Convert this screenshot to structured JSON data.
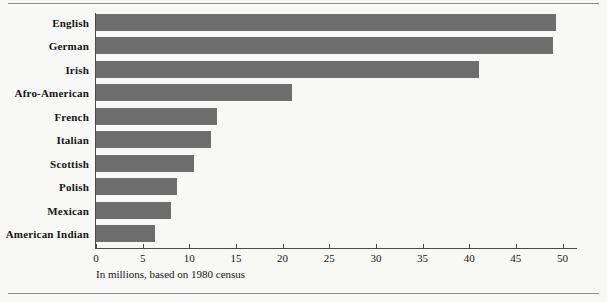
{
  "chart_data": {
    "type": "bar",
    "orientation": "horizontal",
    "title": "",
    "subtitle": "",
    "caption": "In millions, based on 1980 census",
    "xlabel": "",
    "ylabel": "",
    "xlim": [
      0,
      51.5
    ],
    "grid": false,
    "legend": null,
    "bar_color": "#6e6e6e",
    "axis_color": "#4a4a4a",
    "background_color": "#f8f8f6",
    "xticks": [
      0,
      5,
      10,
      15,
      20,
      25,
      30,
      35,
      40,
      45,
      50
    ],
    "xtick_labels": [
      "0",
      "5",
      "10",
      "15",
      "20",
      "25",
      "30",
      "35",
      "40",
      "45",
      "50"
    ],
    "categories": [
      "English",
      "German",
      "Irish",
      "Afro-American",
      "French",
      "Italian",
      "Scottish",
      "Polish",
      "Mexican",
      "American Indian"
    ],
    "values": [
      49.3,
      49.0,
      41.0,
      21.0,
      13.0,
      12.3,
      10.5,
      8.7,
      8.0,
      6.3
    ],
    "units": "millions"
  }
}
